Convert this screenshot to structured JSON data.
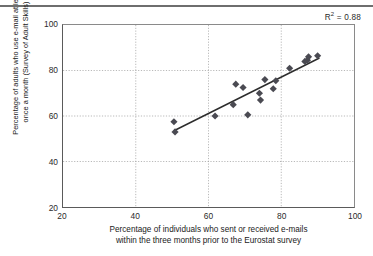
{
  "annotations": {
    "r2_prefix": "R",
    "r2_superscript": "2",
    "r2_value": " = 0.88"
  },
  "chart_data": {
    "type": "scatter",
    "title": "",
    "subtitle": "",
    "xlabel_line1": "Percentage of individuals who sent or received e-mails",
    "xlabel_line2": "within the three months prior to the Eurostat survey",
    "ylabel_line1": "Percentage of adults who use e-mail at least",
    "ylabel_line2": "once a month (Survey of Adult Skills)",
    "xlim": [
      20,
      100
    ],
    "ylim": [
      20,
      100
    ],
    "xticks": [
      20,
      40,
      60,
      80,
      100
    ],
    "yticks": [
      20,
      40,
      60,
      80,
      100
    ],
    "grid": true,
    "grid_style": "dotted",
    "r_squared": 0.88,
    "marker_shape": "diamond",
    "marker_color": "#4a4a52",
    "trendline": {
      "type": "linear",
      "x_start": 50.5,
      "y_start": 53.5,
      "x_end": 90.5,
      "y_end": 85.5,
      "color": "#2b2b2b"
    },
    "points": [
      {
        "x": 50.5,
        "y": 57.5
      },
      {
        "x": 50.8,
        "y": 53.0
      },
      {
        "x": 61.8,
        "y": 60.0
      },
      {
        "x": 66.8,
        "y": 65.0
      },
      {
        "x": 67.5,
        "y": 74.0
      },
      {
        "x": 69.5,
        "y": 72.5
      },
      {
        "x": 70.8,
        "y": 60.5
      },
      {
        "x": 74.0,
        "y": 70.0
      },
      {
        "x": 74.3,
        "y": 67.0
      },
      {
        "x": 75.5,
        "y": 76.0
      },
      {
        "x": 77.8,
        "y": 72.0
      },
      {
        "x": 78.5,
        "y": 75.5
      },
      {
        "x": 82.3,
        "y": 81.0
      },
      {
        "x": 86.5,
        "y": 84.0
      },
      {
        "x": 87.2,
        "y": 84.5
      },
      {
        "x": 87.5,
        "y": 86.0
      },
      {
        "x": 90.0,
        "y": 86.5
      }
    ]
  }
}
